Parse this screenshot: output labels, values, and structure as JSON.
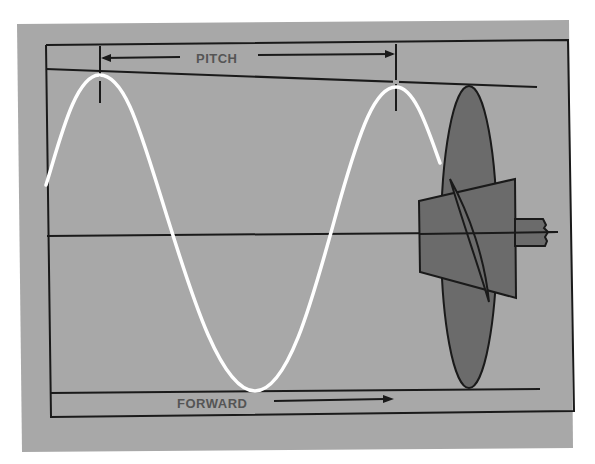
{
  "diagram": {
    "labels": {
      "pitch": "PITCH",
      "forward": "FORWARD"
    },
    "colors": {
      "background_panel": "#a8a8a8",
      "page": "#ffffff",
      "lines": "#1a1a1a",
      "helix_path": "#ffffff",
      "propeller_fill": "#6b6b6b",
      "text": "#555555"
    },
    "elements": {
      "helix_path": "sine-wave helical path traced by propeller blade tip",
      "pitch_dimension": "distance between successive wave crests",
      "propeller": "side view of propeller: elliptical blade, tapered hub, broken shaft",
      "forward_arrow": "direction of travel to the right"
    }
  }
}
